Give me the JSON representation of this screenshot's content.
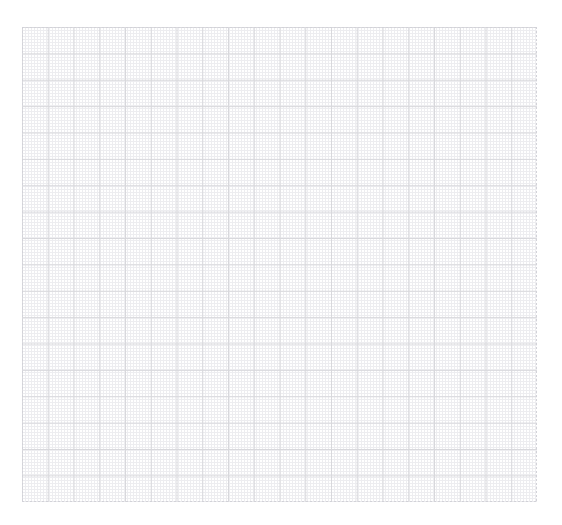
{
  "page": {
    "background_color": "#ffffff",
    "width": 562,
    "height": 525
  },
  "artifacts": {
    "top_left_mark": "",
    "top_right_mark": ""
  },
  "plot": {
    "name": "empty-grid-plot",
    "x": 22,
    "y": 27,
    "width": 515,
    "height": 475,
    "major_cell_width": 25.75,
    "major_cell_height": 26.39,
    "major_columns": 20,
    "major_rows": 18,
    "minor_per_major": 5,
    "major_line_color": "#d8d8dc",
    "minor_line_color": "#ededf0",
    "frame_line_color": "#d2d2d8",
    "frame_style": "dashed"
  },
  "chart_data": {
    "type": "scatter",
    "title": "",
    "subtitle": "",
    "xlabel": "",
    "ylabel": "",
    "series": [
      {
        "name": "",
        "x": [],
        "y": []
      }
    ],
    "categories": [],
    "values": [],
    "xticklabels": [],
    "yticklabels": [],
    "xlim": [
      0,
      20
    ],
    "ylim": [
      0,
      18
    ],
    "grid": true,
    "minor_grid": true,
    "legend": false,
    "legend_position": "none",
    "annotations": [],
    "note": "Blank graph-paper style axes; no data series, tick labels, title or legend are rendered in the image."
  }
}
